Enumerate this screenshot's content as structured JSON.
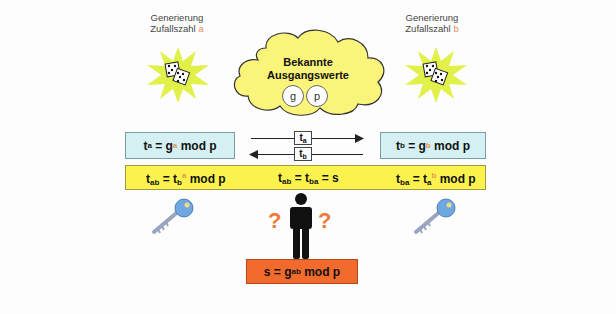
{
  "cloud": {
    "title_line1": "Bekannte",
    "title_line2": "Ausgangswerte",
    "values": [
      "g",
      "p"
    ],
    "color": "#fbf47a"
  },
  "party_a": {
    "caption_line1": "Generierung",
    "caption_line2": "Zufallszahl",
    "variable": "a",
    "icon": "dice-icon",
    "public_formula": {
      "t": "t",
      "t_sub": "a",
      "eq": " = g",
      "exp": "a",
      "rest": " mod p"
    },
    "key_formula": {
      "lhs": "t",
      "lhs_sub": "ab",
      "eq": " = t",
      "base_sub": "b",
      "exp": "a",
      "rest": " mod p"
    }
  },
  "party_b": {
    "caption_line1": "Generierung",
    "caption_line2": "Zufallszahl",
    "variable": "b",
    "icon": "dice-icon",
    "public_formula": {
      "t": "t",
      "t_sub": "b",
      "eq": " = g",
      "exp": "b",
      "rest": " mod p"
    },
    "key_formula": {
      "lhs": "t",
      "lhs_sub": "ba",
      "eq": " = t",
      "base_sub": "a",
      "exp": "b",
      "rest": " mod p"
    }
  },
  "exchange": {
    "to_right": {
      "label": "t",
      "sub": "a"
    },
    "to_left": {
      "label": "t",
      "sub": "b"
    }
  },
  "shared": {
    "t1": "t",
    "t1_sub": "ab",
    "eq1": " = t",
    "t2_sub": "ba",
    "eq2": " = s"
  },
  "eavesdropper": {
    "question_marks": [
      "?",
      "?"
    ],
    "formula": {
      "lhs": "s = g",
      "exp": "ab",
      "rest": " mod p"
    }
  },
  "colors": {
    "box_blue": "#d4f0f2",
    "bar_yellow": "#fbf24d",
    "box_orange": "#f26a2c",
    "star_green": "#e2f04a",
    "key_blue": "#6fa8e0",
    "question_orange": "#f07a3a"
  }
}
